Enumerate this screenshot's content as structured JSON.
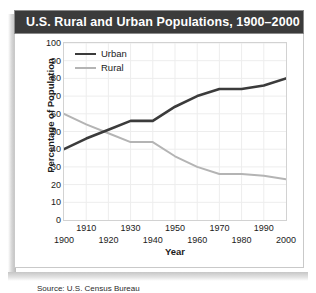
{
  "card": {
    "title": "U.S. Rural and Urban Populations, 1900–2000",
    "source_note": "Source: U.S. Census Bureau"
  },
  "legend": {
    "position": "top-left",
    "entries": [
      {
        "label": "Urban",
        "color": "#3b3b3b"
      },
      {
        "label": "Rural",
        "color": "#b4b4b4"
      }
    ]
  },
  "chart_data": {
    "type": "line",
    "title": "U.S. Rural and Urban Populations, 1900–2000",
    "xlabel": "Year",
    "ylabel": "Percentage of Population",
    "xlim": [
      1900,
      2000
    ],
    "ylim": [
      0,
      100
    ],
    "xticks": [
      1900,
      1910,
      1920,
      1930,
      1940,
      1950,
      1960,
      1970,
      1980,
      1990,
      2000
    ],
    "yticks": [
      0,
      10,
      20,
      30,
      40,
      50,
      60,
      70,
      80,
      90,
      100
    ],
    "grid": true,
    "legend_position": "top-left",
    "x": [
      1900,
      1910,
      1920,
      1930,
      1940,
      1950,
      1960,
      1970,
      1980,
      1990,
      2000
    ],
    "series": [
      {
        "name": "Urban",
        "color": "#3b3b3b",
        "values": [
          40,
          46,
          51,
          56,
          56,
          64,
          70,
          74,
          74,
          76,
          80
        ]
      },
      {
        "name": "Rural",
        "color": "#b4b4b4",
        "values": [
          60,
          54,
          49,
          44,
          44,
          36,
          30,
          26,
          26,
          25,
          23
        ]
      }
    ]
  }
}
